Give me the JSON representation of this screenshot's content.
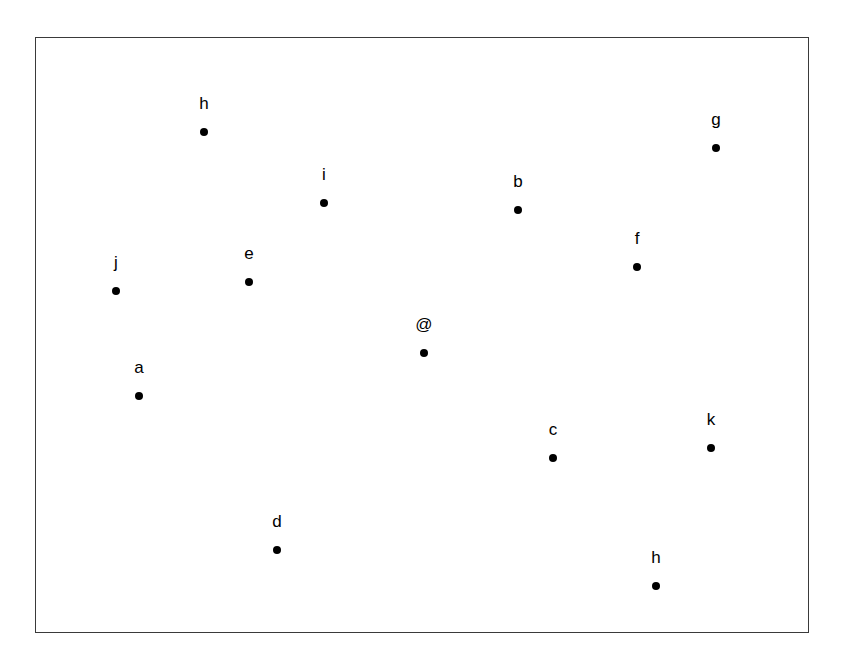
{
  "figure": {
    "title": "",
    "background_color": "#ffffff",
    "frame": {
      "x": 35,
      "y": 37,
      "width": 774,
      "height": 596,
      "border_color": "#3a3a3a",
      "border_width": 1.6,
      "fill_color": "#ffffff"
    },
    "marker": {
      "shape": "circle",
      "color": "#000000",
      "diameter": 8
    },
    "label": {
      "color": "#000000",
      "font_size": 17,
      "offset_y": -20
    }
  },
  "chart_data": {
    "type": "scatter",
    "title": "",
    "xlabel": "",
    "ylabel": "",
    "xlim": [
      35,
      809
    ],
    "ylim": [
      37,
      633
    ],
    "grid": false,
    "legend": "none",
    "axes_visible": false,
    "point_count": 13,
    "labels": [
      "h",
      "g",
      "i",
      "b",
      "f",
      "e",
      "j",
      "@",
      "a",
      "k",
      "c",
      "d",
      "h"
    ],
    "x": [
      203,
      715,
      323,
      517,
      636,
      248,
      115,
      423,
      138,
      710,
      552,
      276,
      655
    ],
    "y": [
      131,
      147,
      202,
      209,
      266,
      281,
      290,
      352,
      395,
      447,
      457,
      549,
      585
    ],
    "points": [
      {
        "label": "h",
        "x": 203,
        "y": 131
      },
      {
        "label": "g",
        "x": 715,
        "y": 147
      },
      {
        "label": "i",
        "x": 323,
        "y": 202
      },
      {
        "label": "b",
        "x": 517,
        "y": 209
      },
      {
        "label": "f",
        "x": 636,
        "y": 266
      },
      {
        "label": "e",
        "x": 248,
        "y": 281
      },
      {
        "label": "j",
        "x": 115,
        "y": 290
      },
      {
        "label": "@",
        "x": 423,
        "y": 352
      },
      {
        "label": "a",
        "x": 138,
        "y": 395
      },
      {
        "label": "k",
        "x": 710,
        "y": 447
      },
      {
        "label": "c",
        "x": 552,
        "y": 457
      },
      {
        "label": "d",
        "x": 276,
        "y": 549
      },
      {
        "label": "h",
        "x": 655,
        "y": 585
      }
    ]
  }
}
